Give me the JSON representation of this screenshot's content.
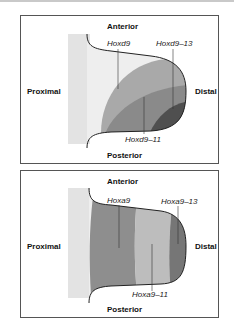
{
  "panels": [
    {
      "id": "hoxd",
      "labels": {
        "anterior": "Anterior",
        "posterior": "Posterior",
        "proximal": "Proximal",
        "distal": "Distal"
      },
      "genes": [
        {
          "name": "Hoxd9",
          "color": "#a9a9a9"
        },
        {
          "name": "Hoxd9–11",
          "color": "#8a8a8a"
        },
        {
          "name": "Hoxd9–13",
          "color": "#4f4f4f"
        }
      ]
    },
    {
      "id": "hoxa",
      "labels": {
        "anterior": "Anterior",
        "posterior": "Posterior",
        "proximal": "Proximal",
        "distal": "Distal"
      },
      "genes": [
        {
          "name": "Hoxa9",
          "color": "#8e8e8e"
        },
        {
          "name": "Hoxa9–11",
          "color": "#bdbdbd"
        },
        {
          "name": "Hoxa9–13",
          "color": "#767676"
        }
      ]
    }
  ],
  "colors": {
    "proximal_region": "#e3e3e3",
    "limb_base": "#eeeeee",
    "outline": "#222222"
  }
}
